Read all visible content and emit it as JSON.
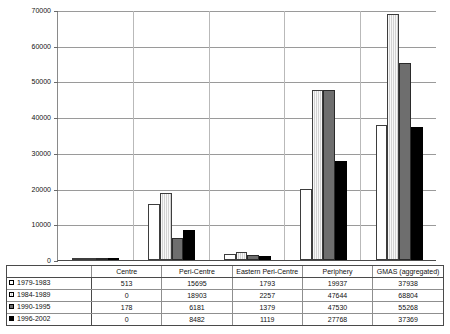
{
  "chart_data": {
    "type": "bar",
    "title": "",
    "xlabel": "",
    "ylabel": "",
    "ylim": [
      0,
      70000
    ],
    "ytick_labels": [
      "70000",
      "60000",
      "50000",
      "40000",
      "30000",
      "20000",
      "10000",
      "0"
    ],
    "ytick_values": [
      70000,
      60000,
      50000,
      40000,
      30000,
      20000,
      10000,
      0
    ],
    "grid": true,
    "legend_position": "table-row-headers",
    "categories": [
      "Centre",
      "Peri-Centre",
      "Eastern Peri-Centre",
      "Periphery",
      "GMAS (aggregated)"
    ],
    "series": [
      {
        "name": "1979-1983",
        "swatch": "white",
        "values": [
          513,
          15695,
          1793,
          19937,
          37938
        ]
      },
      {
        "name": "1984-1989",
        "swatch": "light-gray",
        "values": [
          0,
          18903,
          2257,
          47644,
          68804
        ]
      },
      {
        "name": "1990-1995",
        "swatch": "dark-gray",
        "values": [
          178,
          6181,
          1379,
          47530,
          55268
        ]
      },
      {
        "name": "1996-2002",
        "swatch": "black",
        "values": [
          0,
          8482,
          1119,
          27768,
          37369
        ]
      }
    ],
    "colors": {
      "series_1979_1983": "#ffffff",
      "series_1984_1989": "#d2d2d2",
      "series_1990_1995": "#6e6e6e",
      "series_1996_2002": "#000000",
      "gridline": "#9a9a9a",
      "axis": "#4a4a4a"
    }
  },
  "table": {
    "corner_label": "",
    "column_headers": [
      "Centre",
      "Peri-Centre",
      "Eastern Peri-Centre",
      "Periphery",
      "GMAS (aggregated)"
    ],
    "rows": [
      {
        "label": "1979-1983",
        "cells": [
          "513",
          "15695",
          "1793",
          "19937",
          "37938"
        ]
      },
      {
        "label": "1984-1989",
        "cells": [
          "0",
          "18903",
          "2257",
          "47644",
          "68804"
        ]
      },
      {
        "label": "1990-1995",
        "cells": [
          "178",
          "6181",
          "1379",
          "47530",
          "55268"
        ]
      },
      {
        "label": "1996-2002",
        "cells": [
          "0",
          "8482",
          "1119",
          "27768",
          "37369"
        ]
      }
    ]
  }
}
